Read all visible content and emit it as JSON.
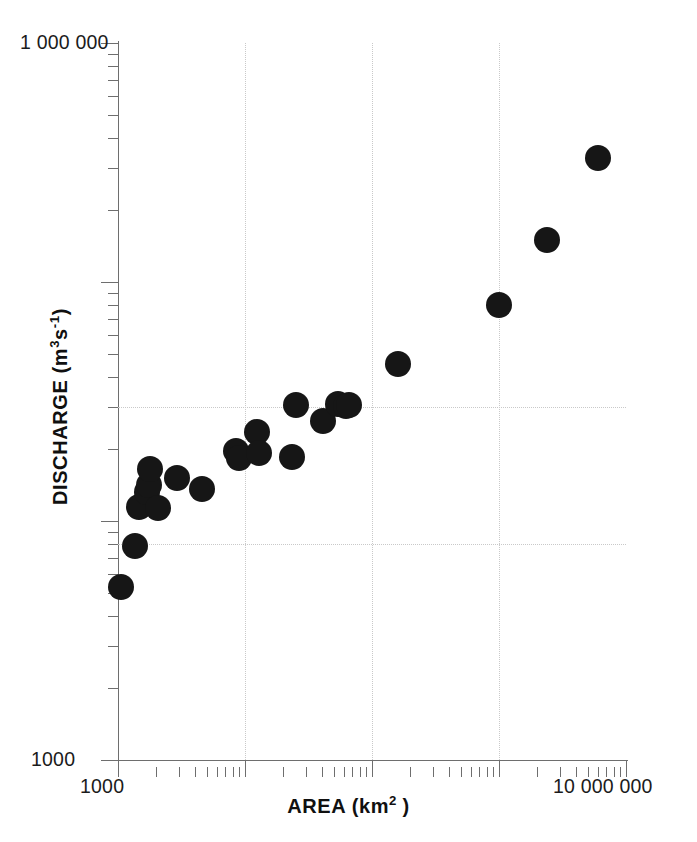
{
  "figure": {
    "background": "#ffffff",
    "marker_color": "#161616",
    "axis_color": "#6e6e6e",
    "grid_color": "#c9c9c9"
  },
  "axis_titles": {
    "x": "AREA (km2)",
    "x_parts": {
      "text": "AREA (km",
      "sup": "2",
      "close": ")"
    },
    "y": "DISCHARGE (m3s-1)",
    "y_parts": {
      "lead": "DISCHARGE (m",
      "sup1": "3",
      "mid": "s",
      "sup2": "-1",
      "close": ")"
    }
  },
  "tick_labels": {
    "y_top": "1 000 000",
    "y_bottom": "1000",
    "x_left": "1000",
    "x_right": "10 000 000"
  },
  "chart_data": {
    "type": "scatter",
    "title": "",
    "xlabel": "AREA (km2)",
    "ylabel": "DISCHARGE (m3s-1)",
    "xscale": "log",
    "yscale": "log",
    "xlim": [
      1000,
      10000000
    ],
    "ylim": [
      1000,
      1000000
    ],
    "xticks_major": [
      1000,
      10000,
      100000,
      1000000,
      10000000
    ],
    "xtick_labels": [
      "1000",
      "",
      "",
      "",
      "10 000 000"
    ],
    "yticks_major": [
      1000,
      10000,
      100000,
      1000000
    ],
    "ytick_labels": [
      "1000",
      "",
      "",
      "1 000 000"
    ],
    "grid": "dotted, major decades only",
    "gridlines_x": [
      10000,
      100000,
      1000000
    ],
    "gridlines_y": [
      30000,
      8000
    ],
    "legend": "none",
    "n_points": 24,
    "series": [
      {
        "name": "rivers",
        "marker": "filled circle",
        "color": "#161616",
        "size_px": 26,
        "points": [
          {
            "x": 1050,
            "y": 5300
          },
          {
            "x": 1350,
            "y": 7900
          },
          {
            "x": 1450,
            "y": 11500
          },
          {
            "x": 1700,
            "y": 13200
          },
          {
            "x": 1750,
            "y": 14200
          },
          {
            "x": 1800,
            "y": 16500
          },
          {
            "x": 2050,
            "y": 11300
          },
          {
            "x": 2900,
            "y": 15200
          },
          {
            "x": 4600,
            "y": 13600
          },
          {
            "x": 8500,
            "y": 19600
          },
          {
            "x": 9000,
            "y": 18300
          },
          {
            "x": 12500,
            "y": 23500
          },
          {
            "x": 12800,
            "y": 19300
          },
          {
            "x": 23500,
            "y": 18600
          },
          {
            "x": 25000,
            "y": 30500
          },
          {
            "x": 41000,
            "y": 26200
          },
          {
            "x": 54000,
            "y": 31000
          },
          {
            "x": 62000,
            "y": 30200
          },
          {
            "x": 66000,
            "y": 30500
          },
          {
            "x": 160000,
            "y": 45500
          },
          {
            "x": 1000000,
            "y": 80000
          },
          {
            "x": 2400000,
            "y": 150000
          },
          {
            "x": 6000000,
            "y": 330000
          }
        ]
      }
    ]
  },
  "geometry": {
    "plot_left_px": 118,
    "plot_top_px": 43,
    "plot_width_px": 508,
    "plot_height_px": 717,
    "decade_x_px": 127,
    "decade_y_px": 239
  }
}
